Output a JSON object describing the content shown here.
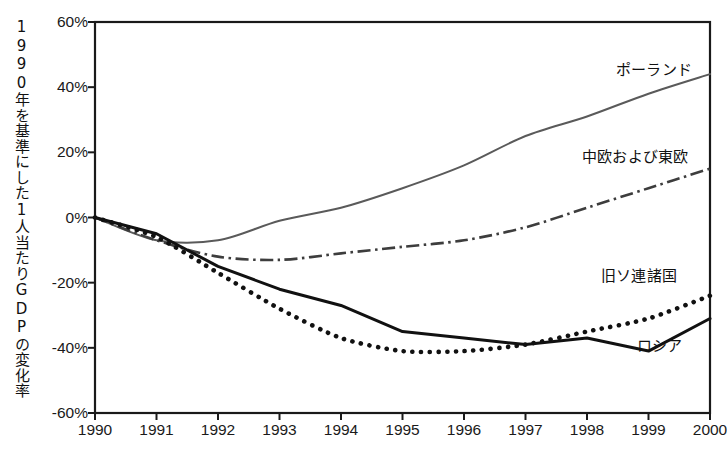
{
  "chart_data": {
    "type": "line",
    "title": "",
    "subtitle": "",
    "xlabel": "",
    "ylabel": "1990年を基準にした1人当たりGDPの変化率",
    "x": [
      1990,
      1991,
      1992,
      1993,
      1994,
      1995,
      1996,
      1997,
      1998,
      1999,
      2000
    ],
    "xtick_labels": [
      "1990",
      "1991",
      "1992",
      "1993",
      "1994",
      "1995",
      "1996",
      "1997",
      "1998",
      "1999",
      "2000"
    ],
    "ytick_labels": [
      "60%",
      "40%",
      "20%",
      "0%",
      "-20%",
      "-40%",
      "-60%"
    ],
    "ytick_values": [
      60,
      40,
      20,
      0,
      -20,
      -40,
      -60
    ],
    "ylim": [
      -60,
      60
    ],
    "xlim": [
      1990,
      2000
    ],
    "grid": false,
    "legend_position": "inline-right-annotations",
    "units": "percent",
    "series": [
      {
        "name": "ポーランド",
        "style": "solid-thin-gray",
        "color": "#555555",
        "label_x": 2000,
        "values": [
          0,
          -7,
          -7,
          -1,
          3,
          9,
          16,
          25,
          31,
          38,
          44
        ]
      },
      {
        "name": "中欧および東欧",
        "style": "dash-dot",
        "color": "#444444",
        "label_x": 2000,
        "values": [
          0,
          -7,
          -12,
          -13,
          -11,
          -9,
          -7,
          -3,
          3,
          9,
          15
        ]
      },
      {
        "name": "旧ソ連諸国",
        "style": "dotted",
        "color": "#111111",
        "label_x": 2000,
        "values": [
          0,
          -6,
          -17,
          -28,
          -37,
          -41,
          -41,
          -39,
          -35,
          -31,
          -24
        ]
      },
      {
        "name": "ロシア",
        "style": "solid-thick-black",
        "color": "#111111",
        "label_x": 2000,
        "values": [
          0,
          -5,
          -15,
          -22,
          -27,
          -35,
          -37,
          -39,
          -37,
          -41,
          -31
        ]
      }
    ]
  },
  "annotations": {
    "poland_label": "ポーランド",
    "cee_label": "中欧および東欧",
    "fsu_label": "旧ソ連諸国",
    "russia_label": "ロシア"
  },
  "axis": {
    "y_title": "1990年を基準にした1人当たりGDPの変化率"
  }
}
